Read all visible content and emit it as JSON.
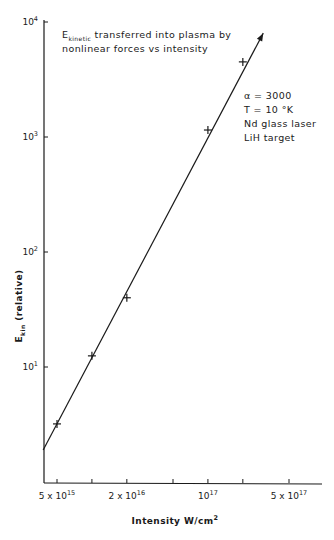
{
  "chart_data": {
    "type": "line",
    "scale": {
      "x": "log",
      "y": "log"
    },
    "title": {
      "line1_main": "E",
      "line1_sub": "kinetic",
      "line1_rest": " transferred into plasma by",
      "line2": "nonlinear forces  vs  intensity"
    },
    "annotations": [
      "α = 3000",
      "T = 10  °K",
      "Nd glass laser",
      "LiH  target"
    ],
    "xlabel": "Intensity  W/cm",
    "xlabel_sup": "2",
    "ylabel_main": "E",
    "ylabel_sub": "kin",
    "ylabel_rest": " (relative)",
    "xlim": [
      3800000000000000.0,
      8e+17
    ],
    "ylim": [
      0.55,
      10000
    ],
    "x_ticks": [
      5000000000000000.0,
      1e+16,
      2e+16,
      5e+16,
      1e+17,
      2e+17,
      5e+17
    ],
    "x_tick_labels": [
      {
        "value": 5000000000000000.0,
        "mant": "5 x 10",
        "exp": "15"
      },
      {
        "value": 2e+16,
        "mant": "2 x 10",
        "exp": "16"
      },
      {
        "value": 1e+17,
        "mant": "10",
        "exp": "17"
      },
      {
        "value": 5e+17,
        "mant": "5 x 10",
        "exp": "17"
      }
    ],
    "y_ticks": [
      10,
      100,
      1000,
      10000
    ],
    "y_tick_labels": [
      {
        "value": 10,
        "mant": "10",
        "exp": "1"
      },
      {
        "value": 100,
        "mant": "10",
        "exp": "2"
      },
      {
        "value": 1000,
        "mant": "10",
        "exp": "3"
      },
      {
        "value": 10000,
        "mant": "10",
        "exp": "4"
      }
    ],
    "series": [
      {
        "name": "measured",
        "marker": "+",
        "points": [
          {
            "x": 5000000000000000.0,
            "y": 3.2
          },
          {
            "x": 1e+16,
            "y": 12.5
          },
          {
            "x": 2e+16,
            "y": 40
          },
          {
            "x": 1e+17,
            "y": 1150
          },
          {
            "x": 2e+17,
            "y": 4500
          }
        ]
      },
      {
        "name": "fit",
        "style": "line-with-arrow",
        "points": [
          {
            "x": 3800000000000000.0,
            "y": 1.9
          },
          {
            "x": 3e+17,
            "y": 8000
          }
        ]
      }
    ],
    "grid": false,
    "legend": "none"
  }
}
